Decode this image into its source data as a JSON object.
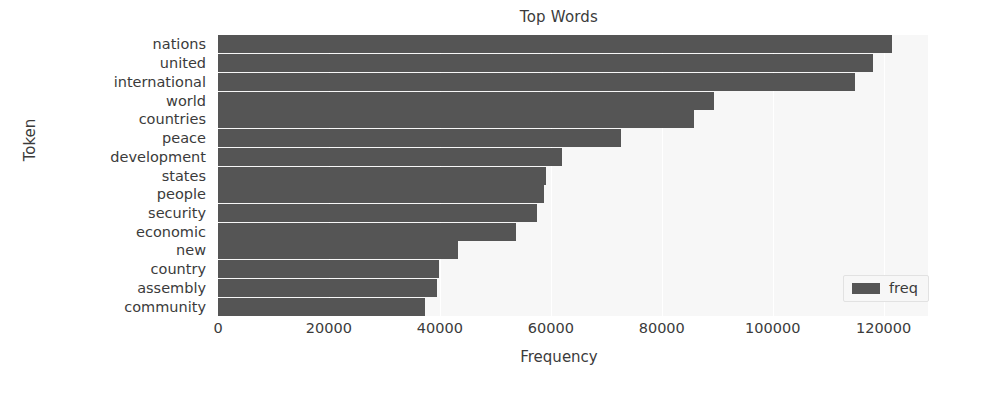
{
  "chart_data": {
    "type": "bar",
    "orientation": "horizontal",
    "title": "Top Words",
    "xlabel": "Frequency",
    "ylabel": "Token",
    "xlim": [
      0,
      128000
    ],
    "xticks": [
      0,
      20000,
      40000,
      60000,
      80000,
      100000,
      120000
    ],
    "xtick_labels": [
      "0",
      "20000",
      "40000",
      "60000",
      "80000",
      "100000",
      "120000"
    ],
    "grid": true,
    "legend": {
      "position": "lower right",
      "entries": [
        {
          "label": "freq",
          "color": "#555555"
        }
      ]
    },
    "bar_color": "#555555",
    "plot_background": "#f7f7f7",
    "categories": [
      "nations",
      "united",
      "international",
      "world",
      "countries",
      "peace",
      "development",
      "states",
      "people",
      "security",
      "economic",
      "new",
      "country",
      "assembly",
      "community"
    ],
    "series": [
      {
        "name": "freq",
        "values": [
          121500,
          118000,
          114800,
          89500,
          85800,
          72600,
          62000,
          59200,
          58800,
          57500,
          53800,
          43200,
          39800,
          39500,
          37300
        ]
      }
    ]
  }
}
